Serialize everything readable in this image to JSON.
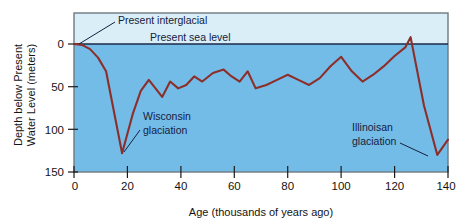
{
  "figure": {
    "background_color": "#ffffff",
    "plot": {
      "upper_band_color": "#d9eef7",
      "lower_band_color": "#74bce8",
      "border_color": "#6d7a80",
      "curve_color": "#8c2f2a",
      "sea_level_line_color": "#1b2a4a"
    }
  },
  "chart_data": {
    "type": "line",
    "title": "",
    "xlabel": "Age (thousands of years ago)",
    "ylabel": "Depth below Present Water Level (meters)",
    "xlim": [
      0,
      140
    ],
    "ylim": [
      150,
      -12
    ],
    "y_inverted": true,
    "xticks": [
      0,
      20,
      40,
      60,
      80,
      100,
      120,
      140
    ],
    "xticklabels": [
      "0",
      "20",
      "40",
      "60",
      "80",
      "100",
      "120",
      "140"
    ],
    "yticks": [
      0,
      50,
      100,
      150
    ],
    "yticklabels": [
      "0",
      "50",
      "100",
      "150"
    ],
    "grid": false,
    "legend": "none",
    "series": [
      {
        "name": "Sea level depth below present",
        "x": [
          0,
          3,
          6,
          9,
          12,
          18,
          22,
          25,
          28,
          30,
          33,
          36,
          39,
          42,
          45,
          48,
          52,
          56,
          59,
          62,
          65,
          68,
          72,
          76,
          80,
          84,
          88,
          92,
          96,
          100,
          104,
          108,
          112,
          116,
          120,
          124,
          126,
          131,
          136,
          140
        ],
        "y": [
          0,
          1,
          6,
          16,
          32,
          128,
          82,
          55,
          42,
          50,
          62,
          44,
          52,
          48,
          38,
          44,
          34,
          30,
          38,
          44,
          32,
          52,
          48,
          42,
          36,
          42,
          48,
          40,
          26,
          15,
          32,
          44,
          36,
          26,
          14,
          4,
          -8,
          72,
          130,
          112
        ]
      }
    ],
    "reference_lines": [
      {
        "name": "present-sea-level",
        "y": 0,
        "label": "Present sea level"
      }
    ],
    "annotations": [
      {
        "name": "present-interglacial",
        "label": "Present interglacial",
        "target_x": 1,
        "target_y": 2
      },
      {
        "name": "wisconsin-glaciation",
        "label_line1": "Wisconsin",
        "label_line2": "glaciation",
        "target_x": 18,
        "target_y": 128
      },
      {
        "name": "illinoisan-glaciation",
        "label_line1": "Illinoisan",
        "label_line2": "glaciation",
        "target_x": 136,
        "target_y": 130
      }
    ]
  },
  "labels": {
    "x_axis_title": "Age (thousands of years ago)",
    "y_axis_title_line1": "Depth below Present",
    "y_axis_title_line2": "Water Level (meters)",
    "sea_level": "Present sea level",
    "present_interglacial": "Present interglacial",
    "wisconsin_line1": "Wisconsin",
    "wisconsin_line2": "glaciation",
    "illinoisan_line1": "Illinoisan",
    "illinoisan_line2": "glaciation",
    "ytick_0": "0",
    "ytick_50": "50",
    "ytick_100": "100",
    "ytick_150": "150",
    "xtick_0": "0",
    "xtick_20": "20",
    "xtick_40": "40",
    "xtick_60": "60",
    "xtick_80": "80",
    "xtick_100": "100",
    "xtick_120": "120",
    "xtick_140": "140"
  }
}
